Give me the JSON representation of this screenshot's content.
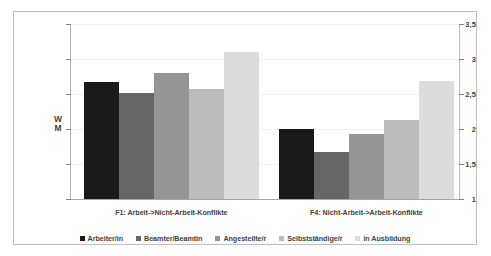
{
  "chart_data": {
    "type": "bar",
    "title": "",
    "subtitle": "",
    "xlabel": "",
    "ylabel": "W\nM",
    "ylim": [
      1,
      3.5
    ],
    "yticks": [
      "1",
      "1,5",
      "2",
      "2,5",
      "3",
      "3,5"
    ],
    "ytick_values": [
      1,
      1.5,
      2,
      2.5,
      3,
      3.5
    ],
    "grid": true,
    "grid_axis": "y",
    "legend_position": "bottom",
    "categories": [
      "F1: Arbeit->Nicht-Arbeit-Konflikte",
      "F4: Nicht-Arbeit->Arbeit-Konflikte"
    ],
    "series": [
      {
        "name": "Arbeiter/in",
        "color": "#1a1a1a",
        "values": [
          2.67,
          2.0
        ]
      },
      {
        "name": "Beamter/Beamtin",
        "color": "#666666",
        "values": [
          2.52,
          1.67
        ]
      },
      {
        "name": "Angestellte/r",
        "color": "#959595",
        "values": [
          2.8,
          1.93
        ]
      },
      {
        "name": "Selbstständige/r",
        "color": "#bcbcbc",
        "values": [
          2.57,
          2.13
        ]
      },
      {
        "name": "in Ausbildung",
        "color": "#dcdcdc",
        "values": [
          3.1,
          2.68
        ]
      }
    ]
  },
  "frame": {
    "border_color": "#bfbfbf",
    "background": "#ffffff"
  }
}
